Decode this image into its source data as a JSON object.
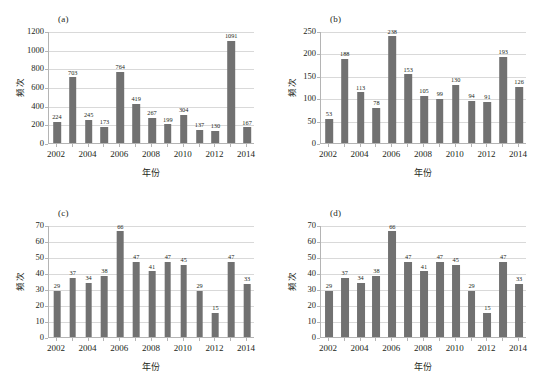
{
  "figure": {
    "background_color": "#ffffff",
    "bar_color": "#717171",
    "axis_color": "#b4b4b4",
    "grid_color": "#d9d9d9",
    "text_color": "#231f20"
  },
  "chart_data": [
    {
      "type": "bar",
      "panel": "(a)",
      "title": "",
      "xlabel": "年份",
      "ylabel": "频次",
      "categories": [
        "2002",
        "2003",
        "2004",
        "2005",
        "2006",
        "2007",
        "2008",
        "2009",
        "2010",
        "2011",
        "2012",
        "2013",
        "2014"
      ],
      "tick_labels": [
        "2002",
        "",
        "2004",
        "",
        "2006",
        "",
        "2008",
        "",
        "2010",
        "",
        "2012",
        "",
        "2014"
      ],
      "values": [
        224,
        703,
        245,
        173,
        764,
        419,
        267,
        199,
        304,
        137,
        130,
        1091,
        167
      ],
      "ylim": [
        0,
        1200
      ],
      "yticks": [
        0,
        200,
        400,
        600,
        800,
        1000,
        1200
      ],
      "grid": true,
      "legend": "none",
      "bar_width_ratio": 0.48
    },
    {
      "type": "bar",
      "panel": "(b)",
      "title": "",
      "xlabel": "年份",
      "ylabel": "频次",
      "categories": [
        "2002",
        "2003",
        "2004",
        "2005",
        "2006",
        "2007",
        "2008",
        "2009",
        "2010",
        "2011",
        "2012",
        "2013",
        "2014"
      ],
      "tick_labels": [
        "2002",
        "",
        "2004",
        "",
        "2006",
        "",
        "2008",
        "",
        "2010",
        "",
        "2012",
        "",
        "2014"
      ],
      "values": [
        53,
        188,
        113,
        78,
        238,
        153,
        105,
        99,
        130,
        94,
        91,
        193,
        126
      ],
      "ylim": [
        0,
        250
      ],
      "yticks": [
        0,
        50,
        100,
        150,
        200,
        250
      ],
      "grid": true,
      "legend": "none",
      "bar_width_ratio": 0.48
    },
    {
      "type": "bar",
      "panel": "(c)",
      "title": "",
      "xlabel": "年份",
      "ylabel": "频次",
      "categories": [
        "2002",
        "2003",
        "2004",
        "2005",
        "2006",
        "2007",
        "2008",
        "2009",
        "2010",
        "2011",
        "2012",
        "2013",
        "2014"
      ],
      "tick_labels": [
        "2002",
        "",
        "2004",
        "",
        "2006",
        "",
        "2008",
        "",
        "2010",
        "",
        "2012",
        "",
        "2014"
      ],
      "values": [
        29,
        37,
        34,
        38,
        66,
        47,
        41,
        47,
        45,
        29,
        15,
        47,
        33
      ],
      "ylim": [
        0,
        70
      ],
      "yticks": [
        0,
        10,
        20,
        30,
        40,
        50,
        60,
        70
      ],
      "grid": true,
      "legend": "none",
      "bar_width_ratio": 0.42
    },
    {
      "type": "bar",
      "panel": "(d)",
      "title": "",
      "xlabel": "年份",
      "ylabel": "频次",
      "categories": [
        "2002",
        "2003",
        "2004",
        "2005",
        "2006",
        "2007",
        "2008",
        "2009",
        "2010",
        "2011",
        "2012",
        "2013",
        "2014"
      ],
      "tick_labels": [
        "2002",
        "",
        "2004",
        "",
        "2006",
        "",
        "2008",
        "",
        "2010",
        "",
        "2012",
        "",
        "2014"
      ],
      "values": [
        29,
        37,
        34,
        38,
        66,
        47,
        41,
        47,
        45,
        29,
        15,
        47,
        33
      ],
      "ylim": [
        0,
        70
      ],
      "yticks": [
        0,
        10,
        20,
        30,
        40,
        50,
        60,
        70
      ],
      "grid": true,
      "legend": "none",
      "bar_width_ratio": 0.5
    }
  ]
}
